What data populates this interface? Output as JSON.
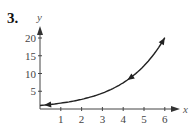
{
  "problem_number": "3.",
  "chart_data": {
    "type": "line",
    "title": "",
    "xlabel": "x",
    "ylabel": "y",
    "xlim": [
      0,
      6.5
    ],
    "ylim": [
      0,
      22
    ],
    "x_ticks": [
      1,
      2,
      3,
      4,
      5,
      6
    ],
    "x_tick_labels": [
      "1",
      "2",
      "3",
      "4",
      "5",
      "6"
    ],
    "y_ticks": [
      5,
      10,
      15,
      20
    ],
    "y_tick_labels": [
      "5",
      "10",
      "15",
      "20"
    ],
    "grid": false,
    "legend": null,
    "series": [
      {
        "name": "parametric curve",
        "x": [
          0,
          0.5,
          1,
          1.5,
          2,
          2.5,
          3,
          3.5,
          4,
          4.5,
          5,
          5.5,
          6
        ],
        "y": [
          1.0,
          1.28,
          1.65,
          2.12,
          2.72,
          3.49,
          4.48,
          5.75,
          7.39,
          9.49,
          12.18,
          15.64,
          20.09
        ],
        "direction": "from (6, 20) toward (0, 1)",
        "arrowheads": [
          {
            "x": 6,
            "y": 20.1,
            "note": "end marker at top"
          },
          {
            "x": 4.2,
            "y": 8.2,
            "note": "mid arrow pointing down-left"
          },
          {
            "x": 0.3,
            "y": 1.2,
            "note": "arrow pointing left"
          }
        ]
      }
    ]
  }
}
